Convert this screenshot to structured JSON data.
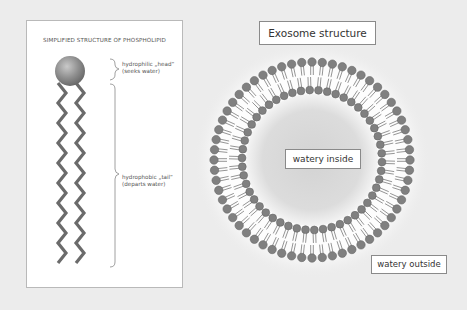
{
  "phospholipid_panel": {
    "title": "SIMPLIFIED STRUCTURE OF PHOSPHOLIPID",
    "head_label_line1": "hydrophilic „head“",
    "head_label_line2": "(seeks water)",
    "tail_label_line1": "hydrophobic „tail“",
    "tail_label_line2": "(departs water)"
  },
  "exosome": {
    "title": "Exosome structure",
    "inside_label": "watery inside",
    "outside_label": "watery outside",
    "outer_layer_molecules": 60,
    "inner_layer_molecules": 50
  },
  "colors": {
    "background": "#ececec",
    "head": "#7d7d7d",
    "tail": "#6b6b6b",
    "core": "#cfcfcf"
  }
}
